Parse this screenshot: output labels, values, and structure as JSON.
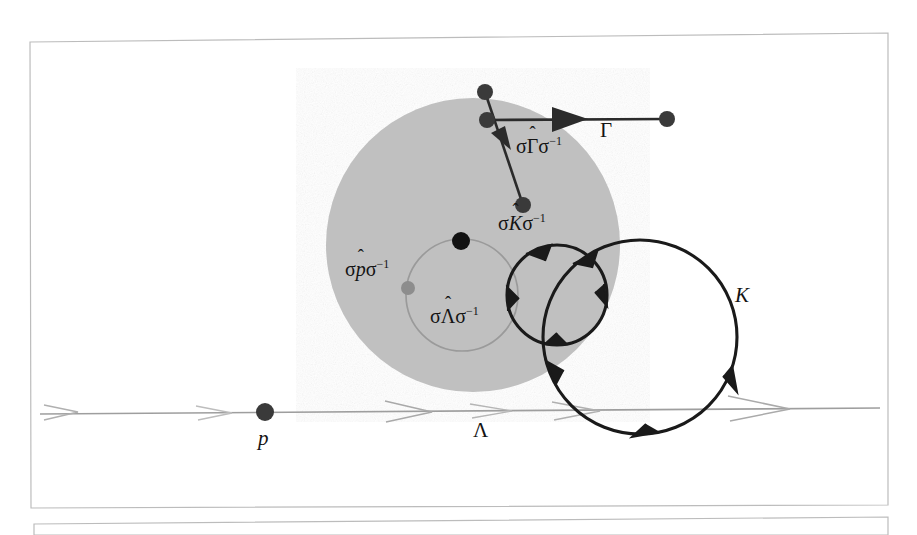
{
  "figure": {
    "kind": "mathematical-diagram",
    "colors": {
      "ink": "#141414",
      "disk_fill": "#c0c0c0",
      "faint_gray": "#9a9a9a",
      "frame": "#b8b8b8",
      "background": "#ffffff"
    }
  },
  "labels": {
    "gamma": {
      "text": "Γ",
      "style": "upright"
    },
    "k": {
      "text": "K",
      "style": "italic"
    },
    "p": {
      "text": "p",
      "style": "italic"
    },
    "lambda": {
      "text": "Λ",
      "style": "upright"
    },
    "conj_gamma": {
      "prefix": "σ",
      "base": "Γ",
      "hat": "ˆ",
      "suffix": "σ",
      "exponent": "−1",
      "style": "upright"
    },
    "conj_k": {
      "prefix": "σ",
      "base": "K",
      "hat": "ˆ",
      "suffix": "σ",
      "exponent": "−1",
      "style": "italic"
    },
    "conj_p": {
      "prefix": "σ",
      "base": "p",
      "hat": "ˆ",
      "suffix": "σ",
      "exponent": "−1",
      "style": "italic"
    },
    "conj_lambda": {
      "prefix": "σ",
      "base": "Λ",
      "hat": "ˆ",
      "suffix": "σ",
      "exponent": "−1",
      "style": "upright"
    }
  },
  "geometry": {
    "frame_outer": {
      "x": 30,
      "y": 36,
      "w": 858,
      "h": 472
    },
    "frame_second_top": {
      "x": 34,
      "y": 518,
      "w": 854,
      "h": 17
    },
    "disk": {
      "cx": 473,
      "cy": 245,
      "r": 147,
      "fill": "#c0c0c0"
    },
    "inner_circle_lambda": {
      "cx": 462,
      "cy": 295,
      "r": 56,
      "stroke": "#9a9a9a"
    },
    "circle_conj_k": {
      "cx": 557,
      "cy": 295,
      "r": 50,
      "stroke": "#141414"
    },
    "circle_k": {
      "cx": 640,
      "cy": 337,
      "r": 97,
      "stroke": "#141414"
    },
    "baseline_lambda": {
      "x1": 40,
      "y1": 414,
      "x2": 880,
      "y2": 408,
      "stroke": "#9a9a9a"
    },
    "arrow_gamma": {
      "x1": 487,
      "y1": 120,
      "x2": 667,
      "y2": 119
    },
    "arrow_conj_gamma": {
      "x1": 485,
      "y1": 92,
      "x2": 523,
      "y2": 205
    },
    "dots": [
      {
        "name": "gamma-start-dot",
        "cx": 487,
        "cy": 120,
        "r": 8,
        "fill": "#3a3a3a"
      },
      {
        "name": "gamma-end-dot",
        "cx": 667,
        "cy": 119,
        "r": 8,
        "fill": "#3a3a3a"
      },
      {
        "name": "conj-gamma-start-dot",
        "cx": 485,
        "cy": 92,
        "r": 8,
        "fill": "#3a3a3a"
      },
      {
        "name": "conj-gamma-end-dot",
        "cx": 523,
        "cy": 205,
        "r": 8,
        "fill": "#3a3a3a"
      },
      {
        "name": "disk-center-dot",
        "cx": 461,
        "cy": 241,
        "r": 9,
        "fill": "#121212"
      },
      {
        "name": "conj-p-dot",
        "cx": 408,
        "cy": 288,
        "r": 7,
        "fill": "#8d8d8d"
      },
      {
        "name": "p-dot",
        "cx": 265,
        "cy": 412,
        "r": 9,
        "fill": "#3a3a3a"
      }
    ]
  },
  "label_positions": {
    "gamma": {
      "x": 600,
      "y": 120
    },
    "conj_gamma": {
      "x": 516,
      "y": 135
    },
    "conj_k": {
      "x": 498,
      "y": 212
    },
    "conj_p": {
      "x": 345,
      "y": 258
    },
    "conj_lambda": {
      "x": 430,
      "y": 305
    },
    "k": {
      "x": 735,
      "y": 285
    },
    "p": {
      "x": 258,
      "y": 428
    },
    "lambda": {
      "x": 473,
      "y": 420
    }
  }
}
